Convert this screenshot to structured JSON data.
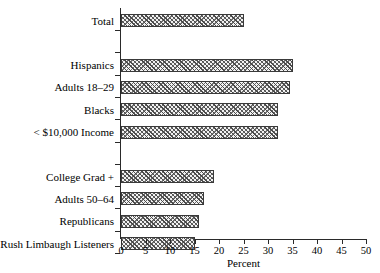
{
  "chart_data": {
    "type": "bar",
    "orientation": "horizontal",
    "title": "",
    "xlabel": "Percent",
    "ylabel": "",
    "xlim": [
      0,
      50
    ],
    "xticks": [
      0,
      5,
      10,
      15,
      20,
      25,
      30,
      35,
      40,
      45,
      50
    ],
    "xtick_labels": [
      "0",
      "5",
      "10",
      "15",
      "20",
      "25",
      "30",
      "35",
      "40",
      "45",
      "50"
    ],
    "grid": false,
    "legend": null,
    "categories": [
      "Total",
      "Hispanics",
      "Adults 18–29",
      "Blacks",
      "< $10,000 Income",
      "College Grad +",
      "Adults 50–64",
      "Republicans",
      "Rush Limbaugh Listeners"
    ],
    "values": [
      25,
      35,
      34.5,
      32,
      32,
      19,
      17,
      16,
      15
    ],
    "bars": [
      {
        "label": "Total",
        "value": 25,
        "row": 0
      },
      {
        "label": "Hispanics",
        "value": 35,
        "row": 2
      },
      {
        "label": "Adults 18–29",
        "value": 34.5,
        "row": 3
      },
      {
        "label": "Blacks",
        "value": 32,
        "row": 4
      },
      {
        "label": "< $10,000 Income",
        "value": 32,
        "row": 5
      },
      {
        "label": "College Grad +",
        "value": 19,
        "row": 7
      },
      {
        "label": "Adults 50–64",
        "value": 17,
        "row": 8
      },
      {
        "label": "Republicans",
        "value": 16,
        "row": 9
      },
      {
        "label": "Rush Limbaugh Listeners",
        "value": 15,
        "row": 10
      }
    ],
    "colors": {
      "bar_fill": "#f2f2f2",
      "bar_hatch": "#4a4a4a",
      "bar_edge": "#3a3a3a",
      "axis": "#2a2a2a",
      "background": "#ffffff",
      "text": "#000000"
    }
  }
}
